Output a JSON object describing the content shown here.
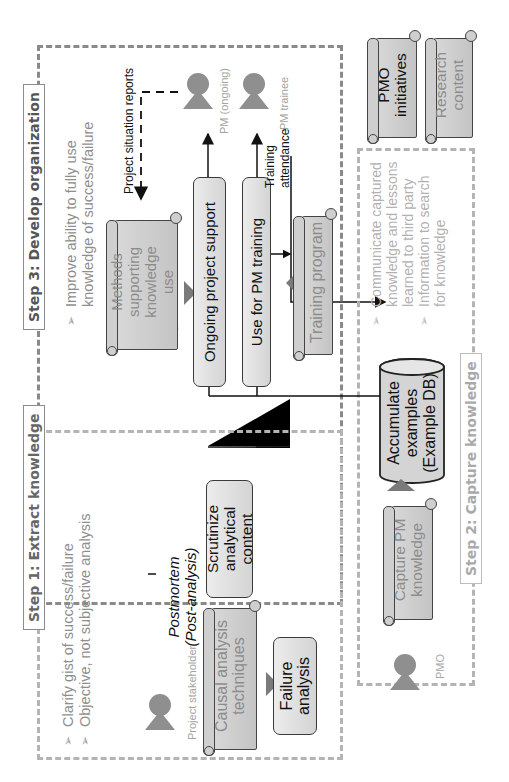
{
  "step1": {
    "title": "Step 1: Extract knowledge",
    "bullets": [
      "Clarify gist of success/failure",
      "Objective, not subjective analysis"
    ],
    "actor": "Project stakeholder",
    "scroll_causal": "Causal analysis techniques",
    "box_failure": "Failure analysis",
    "postmortem_line1": "Postmortem",
    "postmortem_line2": "(Post-analysis)",
    "box_scrutinize": "Scrutinize analytical content"
  },
  "step2": {
    "title": "Step 2: Capture knowledge",
    "bullets": [
      "Communicate captured knowledge and lessons learned to third party",
      "Information to search for knowledge"
    ],
    "actor": "PMO",
    "scroll_capture": "Capture PM knowledge",
    "db": "Accumulate examples (Example DB)"
  },
  "step3": {
    "title": "Step 3: Develop organization",
    "bullets": [
      "Improve ability to fully use knowledge of success/failure"
    ],
    "actor": "PMO",
    "scroll_methods": "Methods supporting knowledge use",
    "box_ongoing": "Ongoing project support",
    "box_training": "Use for PM training",
    "scroll_program": "Training program",
    "label_reports": "Project situation reports",
    "label_attendance_1": "Training",
    "label_attendance_2": "attendance",
    "actor_pm_ongoing": "PM (ongoing)",
    "actor_pm_trainee": "PM trainee"
  },
  "legend_scrolls": {
    "pmo_initiatives": "PMO initiatives",
    "research_content": "Research content"
  },
  "colors": {
    "dash_dark": "#8a8a8a",
    "dash_light": "#b4b4b4",
    "box_fill": "#dedede",
    "person": "#8f8f8f",
    "arrowhead": "#7a7a7a"
  }
}
